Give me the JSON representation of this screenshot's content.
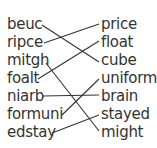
{
  "left_words": [
    "beuc",
    "ripce",
    "mitgh",
    "foalt",
    "niarb",
    "formuni",
    "edstay"
  ],
  "right_words": [
    "price",
    "float",
    "cube",
    "uniform",
    "brain",
    "stayed",
    "might"
  ],
  "connections": [
    {
      "from": "beuc",
      "to": "cube"
    },
    {
      "from": "ripce",
      "to": "price"
    },
    {
      "from": "mitgh",
      "to": "might"
    },
    {
      "from": "foalt",
      "to": "float"
    },
    {
      "from": "niarb",
      "to": "brain"
    },
    {
      "from": "formuni",
      "to": "uniform"
    },
    {
      "from": "edstay",
      "to": "stayed"
    }
  ],
  "colors": {
    "text": "#333333",
    "line": "#333333",
    "background": "#ffffff"
  }
}
